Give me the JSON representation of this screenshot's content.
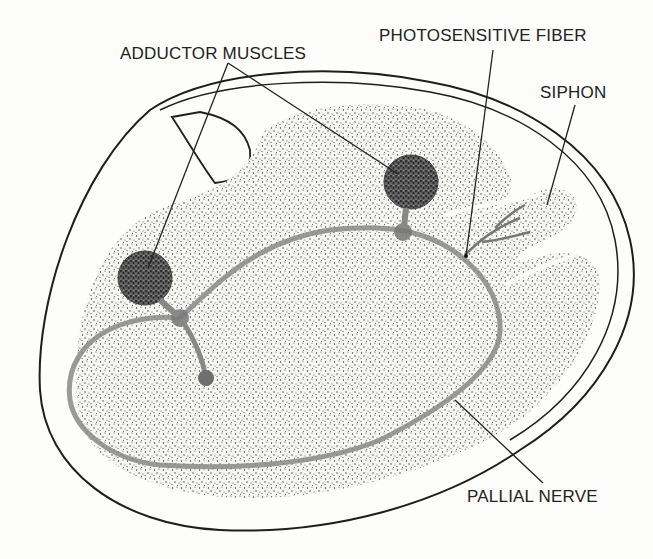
{
  "diagram": {
    "labels": {
      "adductor_muscles": "ADDUCTOR MUSCLES",
      "photosensitive_fiber": "PHOTOSENSITIVE FIBER",
      "siphon": "SIPHON",
      "pallial_nerve": "PALLIAL NERVE"
    },
    "colors": {
      "background": "#fdfdfb",
      "outline": "#1e1e1e",
      "stipple": "#3a3a3a",
      "nerve": "#8a8a8a",
      "muscle": "#3c3c3c"
    }
  }
}
